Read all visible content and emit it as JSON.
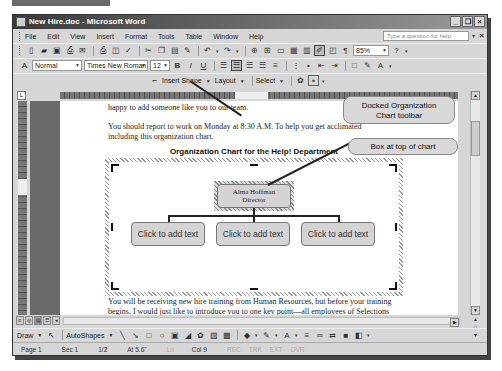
{
  "window": {
    "title": "New Hire.doc - Microsoft Word",
    "controls": [
      "_",
      "❐",
      "×"
    ]
  },
  "menubar": {
    "items": [
      "File",
      "Edit",
      "View",
      "Insert",
      "Format",
      "Tools",
      "Table",
      "Window",
      "Help"
    ],
    "help_placeholder": "Type a question for help",
    "help_close": "×"
  },
  "standard_toolbar": {
    "zoom": "85%"
  },
  "formatting_toolbar": {
    "style": "Normal",
    "font": "Times New Roman",
    "size": "12"
  },
  "org_chart_toolbar": {
    "insert_shape": "Insert Shape",
    "layout": "Layout",
    "select": "Select"
  },
  "document": {
    "para1": "happy to add someone like you to our team.",
    "para2_line1": "You should report to work on Monday at 8:30 A.M. To help you get acclimated",
    "para2_line2": "including this organization chart.",
    "chart_title": "Organization Chart for the Help! Department",
    "para3_line1": "You will be receiving new hire training from Human Resources, but before your training",
    "para3_line2": "begins, I would just like to introduce you to one key point—all employees of Selections"
  },
  "org_chart": {
    "top_box": {
      "name": "Alma Hoffman",
      "title": "Director"
    },
    "sub_boxes": [
      "Click to add text",
      "Click to add text",
      "Click to add text"
    ]
  },
  "callouts": {
    "toolbar_line1": "Docked Organization",
    "toolbar_line2": "Chart toolbar",
    "box": "Box at top of chart"
  },
  "drawing_toolbar": {
    "draw": "Draw",
    "autoshapes": "AutoShapes"
  },
  "statusbar": {
    "page": "Page 1",
    "sec": "Sec 1",
    "pages": "1/2",
    "at": "At 5.6\"",
    "ln": "Ln",
    "col": "Col 9",
    "rec": "REC",
    "trk": "TRK",
    "ext": "EXT",
    "ovr": "OVR"
  }
}
